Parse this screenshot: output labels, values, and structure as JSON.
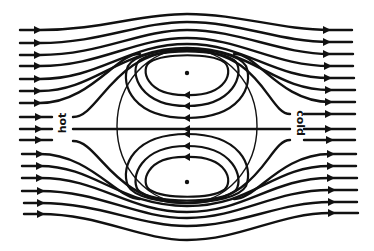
{
  "figure": {
    "type": "streamline-diagram",
    "labels": {
      "left": "hot",
      "right": "cold"
    },
    "colors": {
      "stroke": "#111111",
      "background": "#ffffff"
    },
    "drop": {
      "cx": 187,
      "cy": 126,
      "rx": 70,
      "ry": 77
    },
    "external_streamlines_left_count": 16,
    "internal_vortices": 2,
    "flow_direction": "left-to-right outside, right-to-left along inner axis"
  }
}
